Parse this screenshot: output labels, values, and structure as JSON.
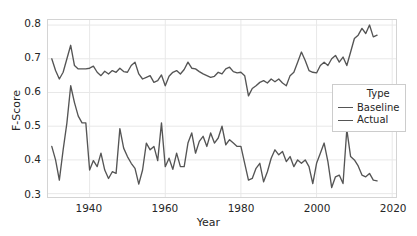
{
  "chart_data": {
    "type": "line",
    "title": "",
    "xlabel": "Year",
    "ylabel": "F-Score",
    "xlim": [
      1929,
      2021
    ],
    "ylim": [
      0.29,
      0.815
    ],
    "xticks": [
      1940,
      1960,
      1980,
      2000,
      2020
    ],
    "yticks": [
      0.3,
      0.4,
      0.5,
      0.6,
      0.7,
      0.8
    ],
    "xtick_labels": [
      "1940",
      "1960",
      "1980",
      "2000",
      "2020"
    ],
    "ytick_labels": [
      "0.3",
      "0.4",
      "0.5",
      "0.6",
      "0.7",
      "0.8"
    ],
    "grid": true,
    "legend": {
      "title": "Type",
      "position": "center-right",
      "entries": [
        "Baseline",
        "Actual"
      ]
    },
    "line_color": "#555555",
    "grid_color": "#e8e8e8",
    "x": [
      1930,
      1931,
      1932,
      1933,
      1934,
      1935,
      1936,
      1937,
      1938,
      1939,
      1940,
      1941,
      1942,
      1943,
      1944,
      1945,
      1946,
      1947,
      1948,
      1949,
      1950,
      1951,
      1952,
      1953,
      1954,
      1955,
      1956,
      1957,
      1958,
      1959,
      1960,
      1961,
      1962,
      1963,
      1964,
      1965,
      1966,
      1967,
      1968,
      1969,
      1970,
      1971,
      1972,
      1973,
      1974,
      1975,
      1976,
      1977,
      1978,
      1979,
      1980,
      1981,
      1982,
      1983,
      1984,
      1985,
      1986,
      1987,
      1988,
      1989,
      1990,
      1991,
      1992,
      1993,
      1994,
      1995,
      1996,
      1997,
      1998,
      1999,
      2000,
      2001,
      2002,
      2003,
      2004,
      2005,
      2006,
      2007,
      2008,
      2009,
      2010,
      2011,
      2012,
      2013,
      2014,
      2015,
      2016
    ],
    "series": [
      {
        "name": "Baseline",
        "values": [
          0.7,
          0.665,
          0.64,
          0.66,
          0.7,
          0.74,
          0.68,
          0.67,
          0.67,
          0.67,
          0.672,
          0.678,
          0.66,
          0.65,
          0.663,
          0.655,
          0.665,
          0.66,
          0.672,
          0.662,
          0.66,
          0.68,
          0.69,
          0.655,
          0.64,
          0.645,
          0.65,
          0.63,
          0.635,
          0.652,
          0.62,
          0.648,
          0.66,
          0.665,
          0.655,
          0.668,
          0.69,
          0.672,
          0.67,
          0.662,
          0.655,
          0.65,
          0.645,
          0.648,
          0.66,
          0.655,
          0.67,
          0.675,
          0.662,
          0.658,
          0.66,
          0.65,
          0.59,
          0.612,
          0.62,
          0.63,
          0.635,
          0.628,
          0.64,
          0.632,
          0.64,
          0.628,
          0.62,
          0.65,
          0.66,
          0.69,
          0.72,
          0.695,
          0.665,
          0.66,
          0.658,
          0.68,
          0.69,
          0.68,
          0.7,
          0.71,
          0.69,
          0.705,
          0.68,
          0.72,
          0.76,
          0.77,
          0.79,
          0.775,
          0.8,
          0.765,
          0.77
        ]
      },
      {
        "name": "Actual",
        "values": [
          0.44,
          0.4,
          0.34,
          0.43,
          0.51,
          0.62,
          0.57,
          0.53,
          0.51,
          0.51,
          0.37,
          0.398,
          0.38,
          0.42,
          0.37,
          0.345,
          0.365,
          0.36,
          0.493,
          0.435,
          0.41,
          0.39,
          0.375,
          0.328,
          0.37,
          0.45,
          0.43,
          0.44,
          0.398,
          0.51,
          0.38,
          0.405,
          0.372,
          0.42,
          0.38,
          0.38,
          0.45,
          0.48,
          0.42,
          0.455,
          0.47,
          0.44,
          0.48,
          0.45,
          0.465,
          0.5,
          0.445,
          0.46,
          0.45,
          0.44,
          0.44,
          0.39,
          0.34,
          0.345,
          0.375,
          0.39,
          0.335,
          0.365,
          0.405,
          0.43,
          0.415,
          0.425,
          0.395,
          0.41,
          0.38,
          0.4,
          0.39,
          0.4,
          0.38,
          0.33,
          0.39,
          0.42,
          0.45,
          0.395,
          0.318,
          0.35,
          0.355,
          0.33,
          0.49,
          0.41,
          0.4,
          0.382,
          0.355,
          0.35,
          0.36,
          0.34,
          0.338
        ]
      }
    ]
  }
}
